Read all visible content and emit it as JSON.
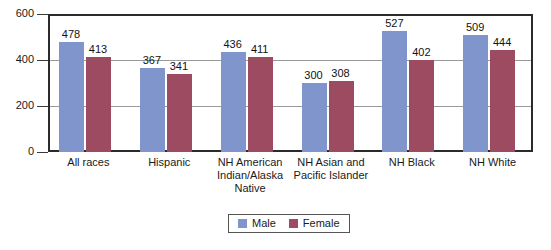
{
  "chart_data": {
    "type": "bar",
    "title": "",
    "subtitle": "",
    "xlabel": "",
    "ylabel": "",
    "ylim": [
      0,
      600
    ],
    "yticks": [
      0,
      200,
      400,
      600
    ],
    "ytick_labels": [
      "0",
      "200",
      "400",
      "600"
    ],
    "grid": true,
    "gridlines_at": [
      200,
      400
    ],
    "legend_position": "bottom-center",
    "categories": [
      "All races",
      "Hispanic",
      "NH American Indian/Alaska Native",
      "NH Asian and Pacific Islander",
      "NH Black",
      "NH White"
    ],
    "category_label_lines": [
      [
        "All races"
      ],
      [
        "Hispanic"
      ],
      [
        "NH American",
        "Indian/Alaska",
        "Native"
      ],
      [
        "NH Asian and",
        "Pacific Islander"
      ],
      [
        "NH Black"
      ],
      [
        "NH White"
      ]
    ],
    "series": [
      {
        "name": "Male",
        "color": "#7f95cc",
        "values": [
          478,
          367,
          436,
          300,
          527,
          509
        ]
      },
      {
        "name": "Female",
        "color": "#9c4b60",
        "values": [
          413,
          341,
          411,
          308,
          402,
          444
        ]
      }
    ]
  },
  "colors": {
    "male": "#7f95cc",
    "female": "#9c4b60",
    "axis": "#2b2b2b",
    "gridline": "#9a9a9a",
    "text": "#1a1a1a",
    "background": "#ffffff",
    "legend_border": "#555555"
  },
  "legend": {
    "items": [
      {
        "label": "Male",
        "swatch": "male-color-swatch"
      },
      {
        "label": "Female",
        "swatch": "female-color-swatch"
      }
    ]
  }
}
